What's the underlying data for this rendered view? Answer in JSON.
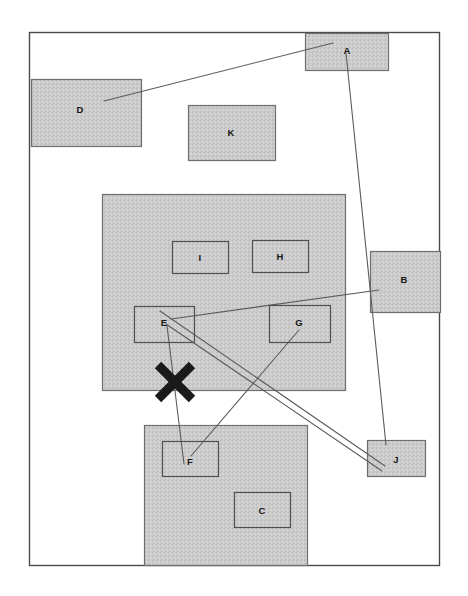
{
  "diagram": {
    "canvas": {
      "width": 468,
      "height": 596
    },
    "colors": {
      "background": "#ffffff",
      "frame_stroke": "#4a4a4a",
      "zone_fill": "#c9c9c9",
      "zone_stroke": "#6e6e6e",
      "subzone_fill": "none",
      "subzone_stroke": "#4f4f4f",
      "connector_stroke": "#5b5b5b",
      "marker_fill": "#1a1a1a",
      "label_color": "#161616"
    },
    "frame": {
      "x": 29,
      "y": 32,
      "width": 410,
      "height": 533
    },
    "zones": [
      {
        "id": "A",
        "label": "A",
        "x": 305,
        "y": 33,
        "width": 83,
        "height": 37,
        "filled": true,
        "label_x": 347,
        "label_y": 51
      },
      {
        "id": "D",
        "label": "D",
        "x": 31,
        "y": 79,
        "width": 110,
        "height": 67,
        "filled": true,
        "label_x": 80,
        "label_y": 110
      },
      {
        "id": "K",
        "label": "K",
        "x": 188,
        "y": 105,
        "width": 87,
        "height": 55,
        "filled": true,
        "label_x": 231,
        "label_y": 133
      },
      {
        "id": "MID",
        "label": "",
        "x": 102,
        "y": 194,
        "width": 243,
        "height": 196,
        "filled": true,
        "label_x": 0,
        "label_y": 0
      },
      {
        "id": "B",
        "label": "B",
        "x": 370,
        "y": 251,
        "width": 70,
        "height": 61,
        "filled": true,
        "label_x": 404,
        "label_y": 280
      },
      {
        "id": "BOT",
        "label": "",
        "x": 144,
        "y": 425,
        "width": 163,
        "height": 140,
        "filled": true,
        "label_x": 0,
        "label_y": 0
      },
      {
        "id": "J",
        "label": "J",
        "x": 367,
        "y": 440,
        "width": 58,
        "height": 36,
        "filled": true,
        "label_x": 396,
        "label_y": 460
      }
    ],
    "subzones": [
      {
        "id": "I",
        "label": "I",
        "x": 172,
        "y": 241,
        "width": 56,
        "height": 32,
        "label_x": 200,
        "label_y": 258
      },
      {
        "id": "H",
        "label": "H",
        "x": 252,
        "y": 240,
        "width": 56,
        "height": 32,
        "label_x": 280,
        "label_y": 257
      },
      {
        "id": "E",
        "label": "E",
        "x": 134,
        "y": 306,
        "width": 60,
        "height": 36,
        "label_x": 164,
        "label_y": 323
      },
      {
        "id": "G",
        "label": "G",
        "x": 269,
        "y": 305,
        "width": 61,
        "height": 37,
        "label_x": 299,
        "label_y": 323
      },
      {
        "id": "F",
        "label": "F",
        "x": 162,
        "y": 441,
        "width": 56,
        "height": 35,
        "label_x": 190,
        "label_y": 462
      },
      {
        "id": "C",
        "label": "C",
        "x": 234,
        "y": 492,
        "width": 56,
        "height": 35,
        "label_x": 262,
        "label_y": 511
      }
    ],
    "connectors": [
      {
        "id": "D-A",
        "from": "D",
        "to": "A",
        "x1": 104,
        "y1": 101,
        "x2": 333,
        "y2": 43
      },
      {
        "id": "A-J",
        "from": "A",
        "to": "J",
        "x1": 346,
        "y1": 53,
        "x2": 386,
        "y2": 445
      },
      {
        "id": "B-E",
        "from": "B",
        "to": "E",
        "x1": 379,
        "y1": 290,
        "x2": 171,
        "y2": 319
      },
      {
        "id": "E-J-upper",
        "from": "E",
        "to": "J",
        "x1": 160,
        "y1": 311,
        "x2": 385,
        "y2": 466
      },
      {
        "id": "E-J-lower",
        "from": "E",
        "to": "J",
        "x1": 166,
        "y1": 324,
        "x2": 382,
        "y2": 471
      },
      {
        "id": "G-F",
        "from": "G",
        "to": "F",
        "x1": 299,
        "y1": 330,
        "x2": 191,
        "y2": 456
      },
      {
        "id": "E-F",
        "from": "E",
        "to": "F",
        "x1": 167,
        "y1": 326,
        "x2": 184,
        "y2": 464
      }
    ],
    "markers": [
      {
        "id": "X1",
        "type": "cross-marker",
        "cx": 175,
        "cy": 382,
        "size": 34,
        "thickness": 9
      }
    ]
  }
}
